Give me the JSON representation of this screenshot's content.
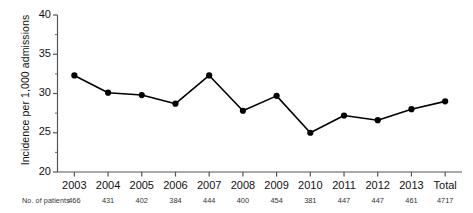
{
  "chart_data": {
    "type": "line",
    "title": "",
    "xlabel": "",
    "ylabel": "Incidence per 1,000 admissions",
    "categories": [
      "2003",
      "2004",
      "2005",
      "2006",
      "2007",
      "2008",
      "2009",
      "2010",
      "2011",
      "2012",
      "2013",
      "Total"
    ],
    "values": [
      32.3,
      30.1,
      29.8,
      28.7,
      32.3,
      27.8,
      29.7,
      25.0,
      27.2,
      26.6,
      28.0,
      29.0
    ],
    "ylim": [
      20,
      40
    ],
    "yticks": [
      20,
      25,
      30,
      35,
      40
    ],
    "ytick_labels": [
      "20",
      "25",
      "30",
      "35",
      "40"
    ],
    "yminorticks": [
      22.5,
      27.5,
      32.5,
      37.5
    ],
    "grid": false,
    "legend": null,
    "marker": "filled-circle",
    "line_color": "#000000",
    "marker_color": "#000000"
  },
  "footer": {
    "row_label": "No. of patients",
    "values": [
      "466",
      "431",
      "402",
      "384",
      "444",
      "400",
      "454",
      "381",
      "447",
      "447",
      "461",
      "4717"
    ]
  },
  "axes": {
    "y_axis_label": "Incidence per 1,000 admissions"
  }
}
